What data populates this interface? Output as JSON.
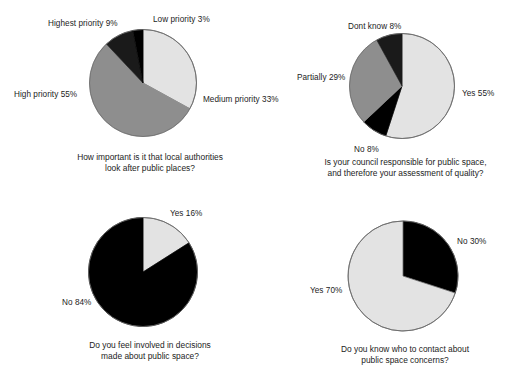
{
  "figure": {
    "title_cropped": "",
    "background_color": "#ffffff",
    "palette": {
      "light": "#e3e3e3",
      "mid": "#8e8e8e",
      "dark": "#1a1a1a",
      "black": "#000000",
      "outline": "#6a6a6a",
      "text": "#1c1c1c"
    }
  },
  "chart_data": [
    {
      "type": "pie",
      "id": "importance-of-local-authorities",
      "title": "",
      "caption": "How important is it that local authorities\nlook after public places?",
      "start_angle_deg": 0,
      "direction": "clockwise",
      "categories": [
        "Medium priority",
        "High priority",
        "Highest priority",
        "Low priority"
      ],
      "values": [
        33,
        55,
        9,
        3
      ],
      "unit": "%",
      "labels": [
        {
          "text": "Medium priority 33%",
          "value": 33,
          "category": "Medium priority",
          "color": "#e3e3e3"
        },
        {
          "text": "High priority  55%",
          "value": 55,
          "category": "High priority",
          "color": "#8e8e8e"
        },
        {
          "text": "Highest priority 9%",
          "value": 9,
          "category": "Highest priority",
          "color": "#1a1a1a"
        },
        {
          "text": "Low priority 3%",
          "value": 3,
          "category": "Low priority",
          "color": "#000000"
        }
      ],
      "legend": "none",
      "grid": false
    },
    {
      "type": "pie",
      "id": "council-responsible-for-public-space",
      "title": "",
      "caption": "Is your council responsible for public space,\nand therefore your assessment of quality?",
      "start_angle_deg": 0,
      "direction": "clockwise",
      "categories": [
        "Yes",
        "No",
        "Partially",
        "Dont know"
      ],
      "values": [
        55,
        8,
        29,
        8
      ],
      "unit": "%",
      "labels": [
        {
          "text": "Yes 55%",
          "value": 55,
          "category": "Yes",
          "color": "#e3e3e3"
        },
        {
          "text": "No 8%",
          "value": 8,
          "category": "No",
          "color": "#000000"
        },
        {
          "text": "Partially 29%",
          "value": 29,
          "category": "Partially",
          "color": "#8e8e8e"
        },
        {
          "text": "Dont know 8%",
          "value": 8,
          "category": "Dont know",
          "color": "#1a1a1a"
        }
      ],
      "legend": "none",
      "grid": false
    },
    {
      "type": "pie",
      "id": "involved-in-decisions",
      "title": "",
      "caption": "Do you feel involved in decisions\nmade about public space?",
      "start_angle_deg": 0,
      "direction": "clockwise",
      "categories": [
        "Yes",
        "No"
      ],
      "values": [
        16,
        84
      ],
      "unit": "%",
      "labels": [
        {
          "text": "Yes 16%",
          "value": 16,
          "category": "Yes",
          "color": "#e3e3e3"
        },
        {
          "text": "No 84%",
          "value": 84,
          "category": "No",
          "color": "#000000"
        }
      ],
      "legend": "none",
      "grid": false
    },
    {
      "type": "pie",
      "id": "know-who-to-contact",
      "title": "",
      "caption": "Do you know who to contact about\npublic space concerns?",
      "start_angle_deg": 0,
      "direction": "clockwise",
      "categories": [
        "No",
        "Yes"
      ],
      "values": [
        30,
        70
      ],
      "unit": "%",
      "labels": [
        {
          "text": "No 30%",
          "value": 30,
          "category": "No",
          "color": "#000000"
        },
        {
          "text": "Yes 70%",
          "value": 70,
          "category": "Yes",
          "color": "#e3e3e3"
        }
      ],
      "legend": "none",
      "grid": false
    }
  ]
}
